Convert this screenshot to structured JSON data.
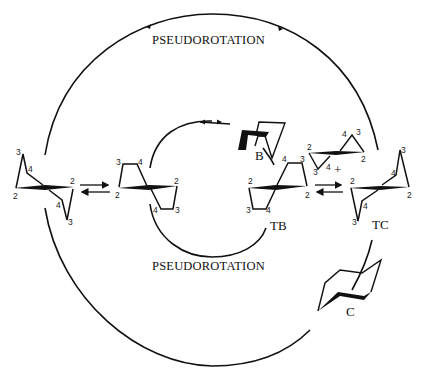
{
  "diagram": {
    "outer_cycle_label": "PSEUDOROTATION",
    "inner_cycle_label": "PSEUDOROTATION",
    "conformers": {
      "boat": "B",
      "twist_boat": "TB",
      "twist_chair": "TC",
      "chair": "C"
    },
    "plus_sign": "+",
    "ring_atom_numbers": {
      "n2": "2",
      "n3": "3",
      "n4": "4"
    },
    "colors": {
      "ink": "#111111",
      "background": "#ffffff"
    }
  }
}
